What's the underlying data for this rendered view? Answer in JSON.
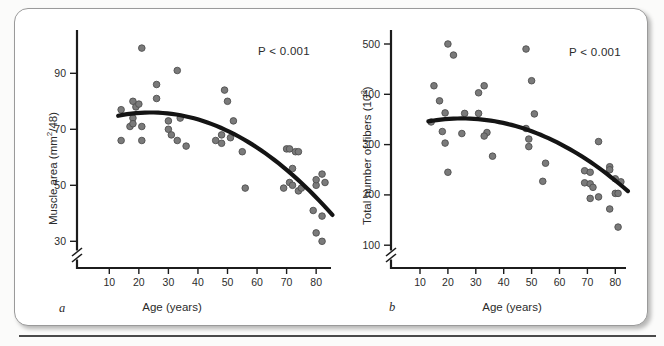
{
  "figure": {
    "bottom_rule": true,
    "colors": {
      "dot_fill": "#7a7a7a",
      "dot_edge": "#4f4f4f",
      "curve": "#141414",
      "axis": "#1c1c1c",
      "text": "#2b2b2b",
      "panel_border": "#9a9a9a"
    }
  },
  "chart_data": [
    {
      "id": "a",
      "type": "scatter",
      "panel_label": "a",
      "annotation": "P < 0.001",
      "xlabel": "Age (years)",
      "ylabel": "Muscle area (mm^2/48)",
      "ylabel_parts": {
        "pre": "Muscle area (mm",
        "sup": "2",
        "post": "/48)"
      },
      "x_ticks": [
        10,
        20,
        30,
        40,
        50,
        60,
        70,
        80
      ],
      "y_ticks": [
        30,
        50,
        70,
        90
      ],
      "xlim": [
        5,
        87
      ],
      "ylim": [
        22,
        102
      ],
      "axis_break_y": true,
      "grid": false,
      "points": [
        [
          14,
          77
        ],
        [
          14,
          66
        ],
        [
          17,
          71
        ],
        [
          18,
          80
        ],
        [
          18,
          74
        ],
        [
          18,
          72
        ],
        [
          19,
          78
        ],
        [
          20,
          79
        ],
        [
          21,
          99
        ],
        [
          21,
          71
        ],
        [
          21,
          66
        ],
        [
          26,
          86
        ],
        [
          26,
          81
        ],
        [
          30,
          73
        ],
        [
          30,
          70
        ],
        [
          31,
          68
        ],
        [
          33,
          91
        ],
        [
          33,
          66
        ],
        [
          34,
          74
        ],
        [
          36,
          64
        ],
        [
          46,
          66
        ],
        [
          48,
          68
        ],
        [
          48,
          65
        ],
        [
          49,
          84
        ],
        [
          50,
          80
        ],
        [
          51,
          67
        ],
        [
          52,
          73
        ],
        [
          55,
          62
        ],
        [
          56,
          49
        ],
        [
          69,
          49
        ],
        [
          70,
          63
        ],
        [
          71,
          51
        ],
        [
          71,
          63
        ],
        [
          72,
          50
        ],
        [
          72,
          56
        ],
        [
          73,
          62
        ],
        [
          74,
          48
        ],
        [
          74,
          62
        ],
        [
          75,
          49
        ],
        [
          79,
          41
        ],
        [
          80,
          33
        ],
        [
          80,
          50
        ],
        [
          80,
          52
        ],
        [
          82,
          30
        ],
        [
          82,
          39
        ],
        [
          82,
          54
        ],
        [
          83,
          51
        ]
      ],
      "trend": {
        "type": "quadratic",
        "peak_x": 24,
        "peak_y": 76,
        "coeff": -0.00967,
        "x_start": 13,
        "x_end": 85.5
      }
    },
    {
      "id": "b",
      "type": "scatter",
      "panel_label": "b",
      "annotation": "P < 0.001",
      "xlabel": "Age (years)",
      "ylabel": "Total number of fibers (10^3)",
      "ylabel_parts": {
        "pre": "Total number of fibers (10",
        "sup": "3",
        "post": ")"
      },
      "x_ticks": [
        10,
        20,
        30,
        40,
        50,
        60,
        70,
        80
      ],
      "y_ticks": [
        100,
        200,
        300,
        400,
        500
      ],
      "xlim": [
        5,
        87
      ],
      "ylim": [
        60,
        520
      ],
      "axis_break_y": true,
      "grid": false,
      "points": [
        [
          20,
          500
        ],
        [
          22,
          478
        ],
        [
          48,
          490
        ],
        [
          15,
          417
        ],
        [
          33,
          417
        ],
        [
          31,
          403
        ],
        [
          50,
          427
        ],
        [
          17,
          387
        ],
        [
          19,
          363
        ],
        [
          26,
          362
        ],
        [
          31,
          362
        ],
        [
          51,
          361
        ],
        [
          14,
          345
        ],
        [
          18,
          326
        ],
        [
          25,
          322
        ],
        [
          34,
          324
        ],
        [
          33,
          317
        ],
        [
          19,
          303
        ],
        [
          36,
          277
        ],
        [
          20,
          245
        ],
        [
          48,
          332
        ],
        [
          49,
          311
        ],
        [
          49,
          296
        ],
        [
          55,
          263
        ],
        [
          54,
          227
        ],
        [
          74,
          306
        ],
        [
          69,
          248
        ],
        [
          71,
          245
        ],
        [
          78,
          256
        ],
        [
          78,
          250
        ],
        [
          69,
          224
        ],
        [
          71,
          222
        ],
        [
          72,
          215
        ],
        [
          80,
          232
        ],
        [
          82,
          226
        ],
        [
          71,
          193
        ],
        [
          74,
          196
        ],
        [
          80,
          203
        ],
        [
          81,
          203
        ],
        [
          78,
          172
        ],
        [
          81,
          136
        ]
      ],
      "trend": {
        "type": "quadratic",
        "peak_x": 25,
        "peak_y": 352,
        "coeff": -0.0408,
        "x_start": 13,
        "x_end": 84.5
      }
    }
  ]
}
